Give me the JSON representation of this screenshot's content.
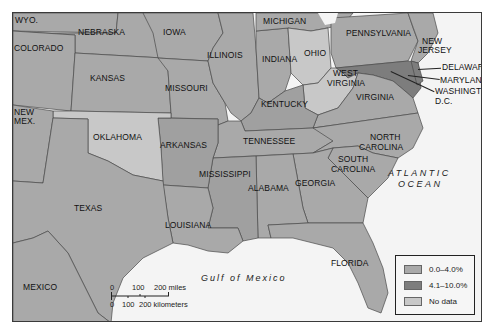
{
  "colors": {
    "range_low": "#a9a9a9",
    "range_high": "#7d7d7d",
    "no_data": "#c8c8c8",
    "water": "#f4f4f4",
    "border": "#3a3a3a"
  },
  "states": {
    "wyoming": "WYO.",
    "nebraska": "NEBRASKA",
    "iowa": "IOWA",
    "michigan": "MICHIGAN",
    "pennsylvania": "PENNSYLVANIA",
    "new_jersey_1": "NEW",
    "new_jersey_2": "JERSEY",
    "colorado": "COLORADO",
    "illinois": "ILLINOIS",
    "indiana": "INDIANA",
    "ohio": "OHIO",
    "delaware": "DELAWARE",
    "maryland": "MARYLAND",
    "washington_dc_1": "WASHINGTON,",
    "washington_dc_2": "D.C.",
    "kansas": "KANSAS",
    "missouri": "MISSOURI",
    "west_virginia_1": "WEST",
    "west_virginia_2": "VIRGINIA",
    "kentucky": "KENTUCKY",
    "virginia": "VIRGINIA",
    "new_mexico_1": "NEW",
    "new_mexico_2": "MEX.",
    "oklahoma": "OKLAHOMA",
    "arkansas": "ARKANSAS",
    "tennessee": "TENNESSEE",
    "north_carolina_1": "NORTH",
    "north_carolina_2": "CAROLINA",
    "south_carolina_1": "SOUTH",
    "south_carolina_2": "CAROLINA",
    "mississippi": "MISSISSIPPI",
    "alabama": "ALABAMA",
    "georgia": "GEORGIA",
    "texas": "TEXAS",
    "louisiana": "LOUISIANA",
    "florida": "FLORIDA",
    "mexico": "MEXICO"
  },
  "water_bodies": {
    "atlantic_1": "ATLANTIC",
    "atlantic_2": "OCEAN",
    "gulf": "Gulf of Mexico"
  },
  "legend": {
    "items": [
      {
        "label": "0.0–4.0%",
        "color": "#a9a9a9"
      },
      {
        "label": "4.1–10.0%",
        "color": "#7d7d7d"
      },
      {
        "label": "No data",
        "color": "#c8c8c8"
      }
    ]
  },
  "scale_bar": {
    "miles_0": "0",
    "miles_100": "100",
    "miles_200": "200 miles",
    "km_0": "0",
    "km_100": "100",
    "km_200": "200 kilometers"
  }
}
